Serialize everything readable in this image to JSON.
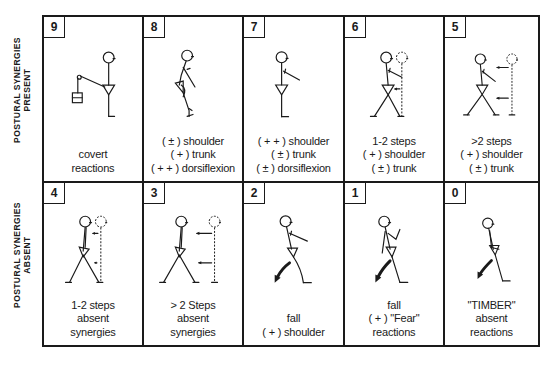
{
  "row_labels": {
    "top": {
      "line1": "POSTURAL SYNERGIES",
      "line2": "PRESENT"
    },
    "bottom": {
      "line1": "POSTURAL SYNERGIES",
      "line2": "ABSENT"
    }
  },
  "cells": [
    {
      "score": "9",
      "figure": "standing-with-pulley-weight",
      "lines": [
        "covert",
        "reactions"
      ]
    },
    {
      "score": "8",
      "figure": "ankle-dorsiflexion-sway",
      "lines": [
        "( ± ) shoulder",
        "( + ) trunk",
        "( + + ) dorsiflexion"
      ]
    },
    {
      "score": "7",
      "figure": "arm-raised-standing",
      "lines": [
        "( + + ) shoulder",
        "( ± ) trunk",
        "( ± ) dorsiflexion"
      ]
    },
    {
      "score": "6",
      "figure": "one-two-steps-with-synergies",
      "lines": [
        "1-2 steps",
        "( + ) shoulder",
        "( ± ) trunk"
      ]
    },
    {
      "score": "5",
      "figure": "more-than-two-steps-with-synergies",
      "lines": [
        ">2 steps",
        "( + ) shoulder",
        "( ± ) trunk"
      ]
    },
    {
      "score": "4",
      "figure": "one-two-steps-no-synergies",
      "lines": [
        "1-2 steps",
        "absent",
        "synergies"
      ]
    },
    {
      "score": "3",
      "figure": "more-than-two-steps-no-synergies",
      "lines": [
        "> 2 Steps",
        "absent",
        "synergies"
      ]
    },
    {
      "score": "2",
      "figure": "fall-with-shoulder",
      "lines": [
        "fall",
        "( + ) shoulder"
      ]
    },
    {
      "score": "1",
      "figure": "fall-with-fear-reaction",
      "lines": [
        "fall",
        "( + ) \"Fear\"",
        "reactions"
      ]
    },
    {
      "score": "0",
      "figure": "timber-fall",
      "lines": [
        "\"TIMBER\"",
        "absent",
        "reactions"
      ]
    }
  ]
}
